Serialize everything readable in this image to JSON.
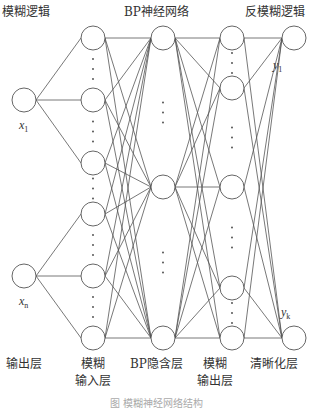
{
  "titles": {
    "fuzzy_logic": "模糊逻辑",
    "bp_network": "BP神经网络",
    "defuzzy_logic": "反模糊逻辑"
  },
  "layers": [
    {
      "id": "output-layer",
      "label": "输出层",
      "x": 24,
      "nodes": [
        100,
        276
      ]
    },
    {
      "id": "fuzzy-input-layer",
      "label_line1": "模糊",
      "label_line2": "输入层",
      "x": 93,
      "nodes": [
        38,
        100,
        163,
        214,
        276,
        338
      ]
    },
    {
      "id": "bp-hidden-layer",
      "label": "BP隐含层",
      "x": 163,
      "nodes": [
        38,
        187,
        338
      ]
    },
    {
      "id": "fuzzy-output-layer",
      "label_line1": "模糊",
      "label_line2": "输出层",
      "x": 232,
      "nodes": [
        38,
        88,
        187,
        288,
        338
      ]
    },
    {
      "id": "defuzzify-layer",
      "label": "清晰化层",
      "x": 294,
      "nodes": [
        38,
        338
      ]
    }
  ],
  "bottom_labels": {
    "output": "输出层",
    "fuzzy_input_1": "模糊",
    "fuzzy_input_2": "输入层",
    "bp_hidden": "BP隐含层",
    "fuzzy_output_1": "模糊",
    "fuzzy_output_2": "输出层",
    "defuzzify": "清晰化层"
  },
  "variables": {
    "x1": "x",
    "x1_sub": "1",
    "xn": "x",
    "xn_sub": "n",
    "y1": "y",
    "y1_sub": "1",
    "yk": "y",
    "yk_sub": "k"
  },
  "caption": "图 模糊神经网络结构",
  "colors": {
    "stroke": "#555555",
    "text": "#333333"
  }
}
